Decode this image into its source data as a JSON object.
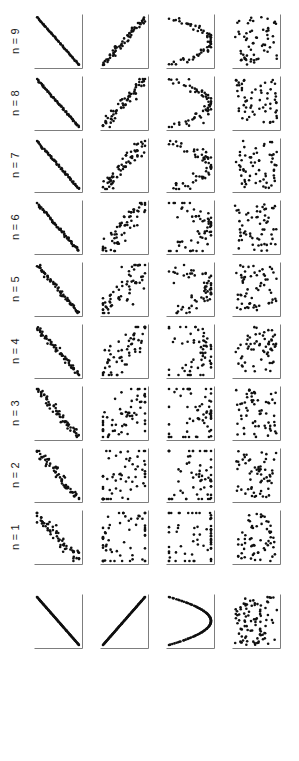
{
  "figure": {
    "title": "",
    "background_color": "#ffffff",
    "axis_color": "#7d7d7d",
    "point_color": "#101010",
    "label_color": "#1a1a1a",
    "rows": 10,
    "columns": 4,
    "panel_width": 52,
    "panel_height": 58,
    "row_labels": [
      "n = 9",
      "n = 8",
      "n = 7",
      "n = 6",
      "n = 5",
      "n = 4",
      "n = 3",
      "n = 2",
      "n = 1",
      ""
    ],
    "column_labels": [
      "",
      "",
      "",
      ""
    ],
    "axis_style": "L-shape with horizontal axis at bottom and vertical axis at right",
    "label_orientation": "rotated 90 degrees counter-clockwise"
  },
  "chart_data": {
    "type": "scatter",
    "title": "",
    "subtitle": "",
    "xlabel": "",
    "ylabel": "",
    "xlim": [
      0,
      1
    ],
    "ylim": [
      0,
      1
    ],
    "grid": false,
    "legend_position": "none",
    "column_patterns": [
      {
        "index": 1,
        "name": "decreasing-linear",
        "label": ""
      },
      {
        "index": 2,
        "name": "increasing-linear",
        "label": ""
      },
      {
        "index": 3,
        "name": "sideways-parabola",
        "label": ""
      },
      {
        "index": 4,
        "name": "random-scatter",
        "label": ""
      }
    ],
    "row_levels": [
      {
        "label": "n = 9",
        "n": 9,
        "noise": 0.035
      },
      {
        "label": "n = 8",
        "n": 8,
        "noise": 0.055
      },
      {
        "label": "n = 7",
        "n": 7,
        "noise": 0.075
      },
      {
        "label": "n = 6",
        "n": 6,
        "noise": 0.1
      },
      {
        "label": "n = 5",
        "n": 5,
        "noise": 0.13
      },
      {
        "label": "n = 4",
        "n": 4,
        "noise": 0.17
      },
      {
        "label": "n = 3",
        "n": 3,
        "noise": 0.24
      },
      {
        "label": "n = 2",
        "n": 2,
        "noise": 0.34
      },
      {
        "label": "n = 1",
        "n": 1,
        "noise": 0.46
      },
      {
        "label": "",
        "n": 0,
        "noise": 0.0
      }
    ],
    "points_per_panel": 60,
    "noise_multipliers": [
      0.15,
      1.0,
      1.0,
      1.0
    ],
    "marker": "dot",
    "marker_size": 1.3
  }
}
